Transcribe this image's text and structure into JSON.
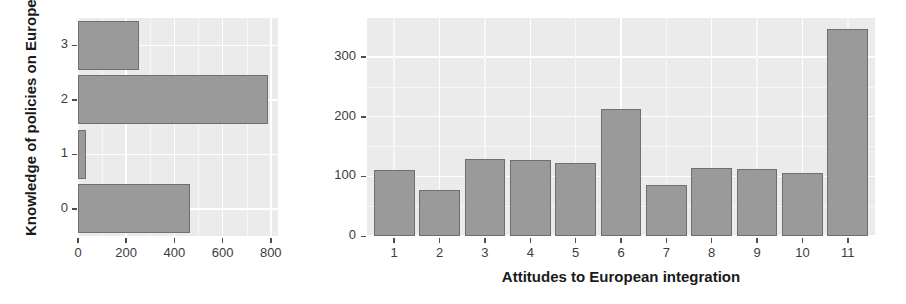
{
  "figure": {
    "background_color": "#ffffff",
    "panel_color": "#ebebeb",
    "bar_fill_color": "#9a9a9a",
    "bar_border_color": "#6f6f6f",
    "grid_color": "#ffffff"
  },
  "chart_data": [
    {
      "id": "knowledge-chart",
      "type": "bar",
      "orientation": "horizontal",
      "title": "",
      "xlabel": "",
      "ylabel": "Knowledge of policies on Europe",
      "categories": [
        "0",
        "1",
        "2",
        "3"
      ],
      "values": [
        464,
        34,
        787,
        253
      ],
      "xlim": [
        0,
        830
      ],
      "ylim": [
        -0.5,
        3.5
      ],
      "xticks": [
        0,
        200,
        400,
        600,
        800
      ],
      "xtick_labels": [
        "0",
        "200",
        "400",
        "600",
        "800"
      ],
      "yticks": [
        0,
        1,
        2,
        3
      ],
      "ytick_labels": [
        "0",
        "1",
        "2",
        "3"
      ],
      "grid": true,
      "legend": "none"
    },
    {
      "id": "attitudes-chart",
      "type": "bar",
      "orientation": "vertical",
      "title": "",
      "xlabel": "Attitudes to European integration",
      "ylabel": "",
      "categories": [
        "1",
        "2",
        "3",
        "4",
        "5",
        "6",
        "7",
        "8",
        "9",
        "10",
        "11"
      ],
      "values": [
        110,
        77,
        129,
        128,
        123,
        213,
        86,
        114,
        113,
        105,
        346
      ],
      "xlim": [
        0.4,
        11.6
      ],
      "ylim": [
        0,
        365
      ],
      "xticks": [
        1,
        2,
        3,
        4,
        5,
        6,
        7,
        8,
        9,
        10,
        11
      ],
      "xtick_labels": [
        "1",
        "2",
        "3",
        "4",
        "5",
        "6",
        "7",
        "8",
        "9",
        "10",
        "11"
      ],
      "yticks": [
        0,
        100,
        200,
        300
      ],
      "ytick_labels": [
        "0",
        "100",
        "200",
        "300"
      ],
      "grid": true,
      "legend": "none"
    }
  ]
}
